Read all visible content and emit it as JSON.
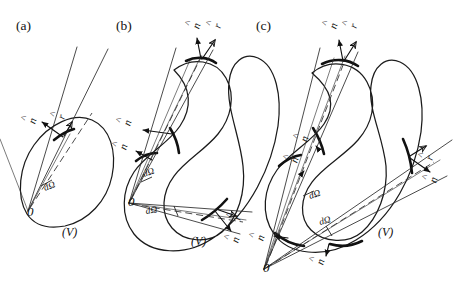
{
  "figure": {
    "background": "#ffffff",
    "ink": "#111111",
    "width": 458,
    "height": 287
  },
  "symbols": {
    "n_hat": "n",
    "r_hat": "r",
    "hat_mark": "^",
    "solid_angle": "dΩ",
    "origin": "0",
    "volume": "(V)"
  },
  "panels": [
    {
      "id": "a",
      "label": "(a)",
      "label_pos": {
        "x": 16,
        "y": 30
      },
      "description": "origin inside volume, cone crosses surface once",
      "origin_label": "0",
      "origin_pos": {
        "x": 27,
        "y": 216
      },
      "volume_label": "(V)",
      "volume_pos": {
        "x": 62,
        "y": 236
      },
      "solid_angle_labels": [
        {
          "text": "dΩ",
          "x": 45,
          "y": 191
        }
      ],
      "vector_labels": [
        {
          "kind": "n-hat",
          "base": "n",
          "x": 33,
          "y": 121
        },
        {
          "kind": "r-hat",
          "base": "r",
          "x": 62,
          "y": 117
        }
      ],
      "crossings": 1
    },
    {
      "id": "b",
      "label": "(b)",
      "label_pos": {
        "x": 116,
        "y": 30
      },
      "description": "origin inside re-entrant volume, cone crosses surface three times",
      "origin_label": "0",
      "origin_pos": {
        "x": 128,
        "y": 206
      },
      "volume_label": "(V)",
      "volume_pos": {
        "x": 191,
        "y": 245
      },
      "solid_angle_labels": [
        {
          "text": "dΩ",
          "x": 144,
          "y": 177
        },
        {
          "text": "dΩ",
          "x": 146,
          "y": 214
        }
      ],
      "vector_labels": [
        {
          "kind": "n-hat",
          "base": "n",
          "x": 197,
          "y": 26
        },
        {
          "kind": "r-hat",
          "base": "r",
          "x": 218,
          "y": 26
        },
        {
          "kind": "n-hat",
          "base": "n",
          "x": 128,
          "y": 123
        },
        {
          "kind": "n-hat",
          "base": "n",
          "x": 124,
          "y": 147
        },
        {
          "kind": "r-hat",
          "base": "r",
          "x": 238,
          "y": 218
        },
        {
          "kind": "n-hat",
          "base": "n",
          "x": 236,
          "y": 240
        }
      ],
      "crossings": 3
    },
    {
      "id": "c",
      "label": "(c)",
      "label_pos": {
        "x": 256,
        "y": 30
      },
      "description": "origin outside volume, cone crosses surface four times",
      "origin_label": "0",
      "origin_pos": {
        "x": 263,
        "y": 272
      },
      "volume_label": "(V)",
      "volume_pos": {
        "x": 378,
        "y": 236
      },
      "solid_angle_labels": [
        {
          "text": "dΩ",
          "x": 310,
          "y": 199
        },
        {
          "text": "dΩ",
          "x": 320,
          "y": 225
        }
      ],
      "vector_labels": [
        {
          "kind": "n-hat",
          "base": "n",
          "x": 334,
          "y": 26
        },
        {
          "kind": "r-hat",
          "base": "r",
          "x": 354,
          "y": 26
        },
        {
          "kind": "n-hat",
          "base": "n",
          "x": 305,
          "y": 139
        },
        {
          "kind": "n-hat",
          "base": "n",
          "x": 295,
          "y": 160
        },
        {
          "kind": "n-hat",
          "base": "n",
          "x": 261,
          "y": 238
        },
        {
          "kind": "n-hat",
          "base": "n",
          "x": 321,
          "y": 262
        },
        {
          "kind": "r-hat",
          "base": "r",
          "x": 430,
          "y": 158
        },
        {
          "kind": "n-hat",
          "base": "n",
          "x": 434,
          "y": 180
        }
      ],
      "crossings": 4
    }
  ]
}
